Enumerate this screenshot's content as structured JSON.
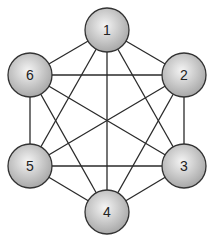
{
  "diagram": {
    "type": "complete-graph",
    "title": "",
    "colors": {
      "edge": "#2a2a2a",
      "node_fill_light": "#f4f4f4",
      "node_fill_dark": "#a8a8a8",
      "node_stroke": "#333333",
      "label": "#222222"
    },
    "node_radius": 22,
    "nodes": [
      {
        "id": "1",
        "label": "1",
        "x": 107,
        "y": 30
      },
      {
        "id": "2",
        "label": "2",
        "x": 184,
        "y": 75
      },
      {
        "id": "3",
        "label": "3",
        "x": 184,
        "y": 166
      },
      {
        "id": "4",
        "label": "4",
        "x": 107,
        "y": 212
      },
      {
        "id": "5",
        "label": "5",
        "x": 30,
        "y": 166
      },
      {
        "id": "6",
        "label": "6",
        "x": 30,
        "y": 75
      }
    ],
    "edges": [
      [
        "1",
        "2"
      ],
      [
        "1",
        "3"
      ],
      [
        "1",
        "4"
      ],
      [
        "1",
        "5"
      ],
      [
        "1",
        "6"
      ],
      [
        "2",
        "3"
      ],
      [
        "2",
        "4"
      ],
      [
        "2",
        "5"
      ],
      [
        "2",
        "6"
      ],
      [
        "3",
        "4"
      ],
      [
        "3",
        "5"
      ],
      [
        "3",
        "6"
      ],
      [
        "4",
        "5"
      ],
      [
        "4",
        "6"
      ],
      [
        "5",
        "6"
      ]
    ]
  }
}
